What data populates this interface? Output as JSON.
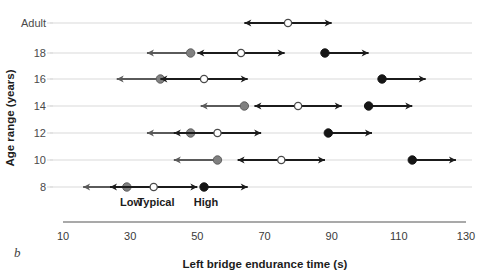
{
  "panel": {
    "letter": "b"
  },
  "chart_data": {
    "type": "scatter",
    "title": "",
    "xlabel": "Left bridge endurance time (s)",
    "ylabel": "Age range (years)",
    "xlim": [
      10,
      130
    ],
    "xticks": [
      10,
      30,
      50,
      70,
      90,
      110,
      130
    ],
    "xticklabels": [
      "10",
      "30",
      "50",
      "70",
      "90",
      "110",
      "130"
    ],
    "categories": [
      "Adult",
      "18",
      "16",
      "14",
      "12",
      "10",
      "8"
    ],
    "grid": true,
    "legend_position": "inside-bottom-left",
    "legend": [
      {
        "label": "Low",
        "marker": "filled-gray-circle",
        "arrow": "left",
        "color": "#808080"
      },
      {
        "label": "Typical",
        "marker": "open-circle",
        "arrow": "none",
        "color": "#ffffff"
      },
      {
        "label": "High",
        "marker": "filled-black-circle",
        "arrow": "right",
        "color": "#151515"
      }
    ],
    "series": [
      {
        "name": "Low",
        "marker": "filled-gray-circle",
        "arrow": "left",
        "values": [
          null,
          48,
          39,
          64,
          48,
          56,
          29
        ]
      },
      {
        "name": "Typical",
        "marker": "open-circle",
        "arrow": "both",
        "values": [
          77,
          63,
          52,
          80,
          56,
          75,
          37
        ]
      },
      {
        "name": "High",
        "marker": "filled-black-circle",
        "arrow": "right",
        "values": [
          null,
          88,
          105,
          101,
          89,
          114,
          52
        ]
      }
    ],
    "arrow_lengths": {
      "Low": [
        null,
        13,
        13,
        13,
        13,
        13,
        13
      ],
      "Typical": [
        13,
        null,
        null,
        null,
        null,
        null,
        null
      ],
      "High": [
        null,
        13,
        13,
        13,
        13,
        13,
        13
      ]
    },
    "colors": {
      "low": "#808080",
      "typical": "#ffffff",
      "high": "#151515",
      "grid": "#d9d9d9",
      "axis": "#8c8c8c"
    }
  }
}
